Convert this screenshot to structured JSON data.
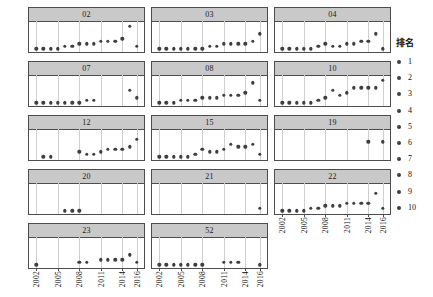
{
  "chart_data": {
    "type": "scatter",
    "title": "",
    "xlabel": "",
    "ylabel": "",
    "xlim": [
      2001,
      2017
    ],
    "ylim": [
      10.5,
      0.5
    ],
    "grid": true,
    "legend": {
      "position": "right",
      "title": "排名",
      "entries": [
        {
          "label": "1"
        },
        {
          "label": "2"
        },
        {
          "label": "3"
        },
        {
          "label": "4"
        },
        {
          "label": "5"
        },
        {
          "label": "6"
        },
        {
          "label": "7"
        },
        {
          "label": "8"
        },
        {
          "label": "9"
        },
        {
          "label": "10"
        }
      ]
    },
    "xticks": [
      "2002",
      "2005",
      "2008",
      "2011",
      "2014",
      "2016"
    ],
    "xtick_values": [
      2002,
      2005,
      2008,
      2011,
      2014,
      2016
    ],
    "panel_layout": {
      "columns": 3,
      "rows": 5
    },
    "panels": [
      {
        "label": "02",
        "row": 0,
        "col": 0,
        "x": [
          2002,
          2003,
          2004,
          2005,
          2006,
          2007,
          2008,
          2009,
          2010,
          2011,
          2012,
          2013,
          2014,
          2015,
          2016
        ],
        "y": [
          10,
          10,
          10,
          10,
          9,
          9,
          8,
          8,
          8,
          7,
          7,
          7,
          6,
          1,
          9
        ]
      },
      {
        "label": "03",
        "row": 0,
        "col": 1,
        "x": [
          2002,
          2003,
          2004,
          2005,
          2006,
          2007,
          2008,
          2009,
          2010,
          2011,
          2012,
          2013,
          2014,
          2015,
          2016
        ],
        "y": [
          10,
          10,
          10,
          10,
          10,
          10,
          10,
          9,
          9,
          8,
          8,
          8,
          8,
          7,
          4
        ]
      },
      {
        "label": "04",
        "row": 0,
        "col": 2,
        "x": [
          2002,
          2003,
          2004,
          2005,
          2006,
          2007,
          2008,
          2009,
          2010,
          2011,
          2012,
          2013,
          2014,
          2015,
          2016
        ],
        "y": [
          10,
          10,
          10,
          10,
          10,
          9,
          8,
          9,
          9,
          8,
          8,
          7,
          7,
          4,
          10
        ]
      },
      {
        "label": "07",
        "row": 1,
        "col": 0,
        "x": [
          2002,
          2003,
          2004,
          2005,
          2006,
          2007,
          2008,
          2009,
          2010,
          2015,
          2016
        ],
        "y": [
          10,
          10,
          10,
          10,
          10,
          10,
          10,
          9,
          9,
          5,
          8
        ]
      },
      {
        "label": "08",
        "row": 1,
        "col": 1,
        "x": [
          2002,
          2003,
          2004,
          2005,
          2006,
          2007,
          2008,
          2009,
          2010,
          2011,
          2012,
          2013,
          2014,
          2015,
          2016
        ],
        "y": [
          10,
          10,
          10,
          9,
          9,
          9,
          8,
          8,
          8,
          7,
          7,
          7,
          6,
          2,
          9
        ]
      },
      {
        "label": "10",
        "row": 1,
        "col": 2,
        "x": [
          2002,
          2003,
          2004,
          2005,
          2006,
          2007,
          2008,
          2009,
          2010,
          2011,
          2012,
          2013,
          2014,
          2015,
          2016
        ],
        "y": [
          10,
          10,
          10,
          10,
          10,
          9,
          8,
          5,
          7,
          6,
          4,
          4,
          4,
          4,
          1
        ]
      },
      {
        "label": "12",
        "row": 2,
        "col": 0,
        "x": [
          2003,
          2004,
          2008,
          2009,
          2010,
          2011,
          2012,
          2013,
          2014,
          2015,
          2016
        ],
        "y": [
          10,
          10,
          8,
          9,
          9,
          8,
          7,
          7,
          7,
          6,
          3
        ]
      },
      {
        "label": "15",
        "row": 2,
        "col": 1,
        "x": [
          2002,
          2003,
          2004,
          2005,
          2006,
          2007,
          2008,
          2009,
          2010,
          2011,
          2012,
          2013,
          2014,
          2015,
          2016
        ],
        "y": [
          10,
          10,
          10,
          10,
          10,
          9,
          7,
          8,
          8,
          7,
          5,
          6,
          6,
          5,
          9
        ]
      },
      {
        "label": "19",
        "row": 2,
        "col": 2,
        "x": [
          2014,
          2016
        ],
        "y": [
          4,
          4
        ]
      },
      {
        "label": "20",
        "row": 3,
        "col": 0,
        "x": [
          2006,
          2007,
          2008
        ],
        "y": [
          10,
          10,
          10
        ]
      },
      {
        "label": "21",
        "row": 3,
        "col": 1,
        "x": [
          2016
        ],
        "y": [
          9
        ]
      },
      {
        "label": "22",
        "row": 3,
        "col": 2,
        "x": [
          2002,
          2003,
          2004,
          2005,
          2006,
          2007,
          2008,
          2009,
          2010,
          2011,
          2012,
          2013,
          2014,
          2015,
          2016
        ],
        "y": [
          10,
          10,
          10,
          10,
          9,
          9,
          8,
          8,
          8,
          7,
          7,
          7,
          7,
          3,
          9
        ]
      },
      {
        "label": "23",
        "row": 4,
        "col": 0,
        "x": [
          2002,
          2008,
          2009,
          2011,
          2012,
          2013,
          2014,
          2015,
          2016
        ],
        "y": [
          10,
          9,
          9,
          8,
          8,
          8,
          8,
          6,
          9
        ]
      },
      {
        "label": "52",
        "row": 4,
        "col": 1,
        "x": [
          2002,
          2003,
          2004,
          2005,
          2006,
          2007,
          2008,
          2011,
          2012,
          2013,
          2016
        ],
        "y": [
          10,
          10,
          10,
          10,
          10,
          10,
          10,
          9,
          9,
          9,
          10
        ]
      }
    ]
  }
}
